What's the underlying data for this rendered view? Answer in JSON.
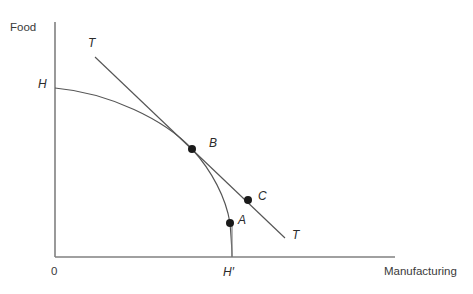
{
  "figure": {
    "background_color": "#ffffff",
    "axis_color": "#808080",
    "curve_color": "#555555",
    "point_color": "#1a1a1a",
    "text_color": "#3a3a3a"
  },
  "axes": {
    "y_title": "Food",
    "x_title": "Manufacturing",
    "origin_label": "0",
    "y_intercept_label": "H",
    "x_tick_label": "H′"
  },
  "annotations": {
    "tangent_upper_label": "T",
    "tangent_lower_label": "T",
    "point_b_label": "B",
    "point_a_label": "A",
    "point_c_label": "C"
  },
  "chart_data": {
    "type": "line",
    "title": "",
    "xlabel": "Manufacturing",
    "ylabel": "Food",
    "grid": false,
    "legend": "none",
    "xlim": [
      0,
      1
    ],
    "ylim": [
      0,
      1
    ],
    "axis_pixels": {
      "x_axis": {
        "x1": 55,
        "y1": 257,
        "x2": 395,
        "y2": 257
      },
      "y_axis": {
        "x1": 55,
        "y1": 22,
        "x2": 55,
        "y2": 257
      }
    },
    "series": [
      {
        "name": "production-possibility-frontier",
        "kind": "curve",
        "path": "M 55 88 C 110 93, 165 120, 192 149 C 212 171, 226 198, 230 223 C 231 236, 232 248, 232 257"
      },
      {
        "name": "tangent-line-TT",
        "kind": "line",
        "path": "M 95 57 L 285 238"
      },
      {
        "name": "dropline-to-H-prime",
        "kind": "line",
        "path": "M 232 223 L 232 257"
      }
    ],
    "points": [
      {
        "label": "B",
        "x": 192,
        "y": 149,
        "note": "tangency of TT with frontier"
      },
      {
        "label": "A",
        "x": 230,
        "y": 223,
        "note": "on frontier below B"
      },
      {
        "label": "C",
        "x": 248,
        "y": 200,
        "note": "on tangent line beyond B"
      }
    ],
    "tick_marks": [
      {
        "label": "H",
        "axis": "y",
        "pixel": 88
      },
      {
        "label": "H′",
        "axis": "x",
        "pixel": 232
      }
    ]
  }
}
